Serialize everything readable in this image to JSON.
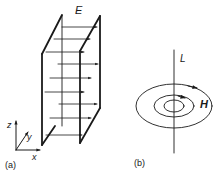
{
  "figure": {
    "panel_a": {
      "label": "(a)",
      "field_label": "E",
      "axes": {
        "x": "x",
        "y": "y",
        "z": "z"
      }
    },
    "panel_b": {
      "label": "(b)",
      "line_label": "L",
      "field_label": "H"
    }
  },
  "colors": {
    "ink": "#1a1a1a",
    "background": "#ffffff"
  }
}
